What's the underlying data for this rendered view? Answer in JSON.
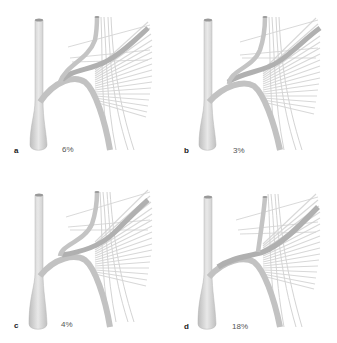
{
  "figure": {
    "colors": {
      "vessel": "#c4c4c4",
      "vessel_dark": "#a9a9a9",
      "vessel_light": "#e3e3e3",
      "muscle_fibers": "#d6d6d6",
      "label": "#222222",
      "percent": "#555555"
    },
    "panels": [
      {
        "letter": "a",
        "percent": "6%",
        "variant": "branch-high-crossing"
      },
      {
        "letter": "b",
        "percent": "3%",
        "variant": "branch-mid-crossing"
      },
      {
        "letter": "c",
        "percent": "4%",
        "variant": "branch-low-crossing"
      },
      {
        "letter": "d",
        "percent": "18%",
        "variant": "single-trunk"
      }
    ]
  }
}
